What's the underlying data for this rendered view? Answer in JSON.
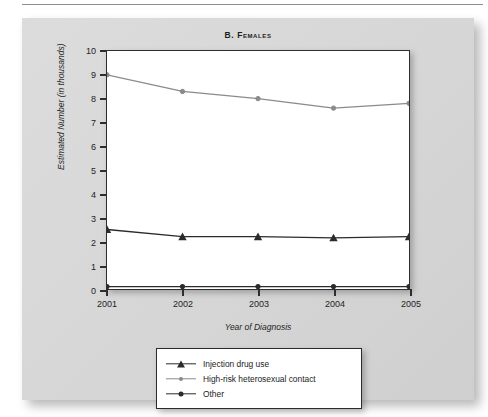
{
  "figure": {
    "title": "B. Females"
  },
  "chart_data": {
    "type": "line",
    "title": "B. Females",
    "xlabel": "Year of Diagnosis",
    "ylabel": "Estimated Number (in thousands)",
    "categories": [
      "2001",
      "2002",
      "2003",
      "2004",
      "2005"
    ],
    "x": [
      2001,
      2002,
      2003,
      2004,
      2005
    ],
    "xlim": [
      2001,
      2005
    ],
    "ylim": [
      0,
      10
    ],
    "yticks": [
      0,
      1,
      2,
      3,
      4,
      5,
      6,
      7,
      8,
      9,
      10
    ],
    "ytick_labels": [
      "0",
      "1",
      "2",
      "3",
      "4",
      "5",
      "6",
      "7",
      "8",
      "9",
      "10"
    ],
    "grid": false,
    "legend_position": "below-center",
    "series": [
      {
        "name": "Injection drug use",
        "marker": "triangle",
        "color": "#2b2b2b",
        "values": [
          2.5,
          2.2,
          2.2,
          2.15,
          2.2
        ]
      },
      {
        "name": "High-risk heterosexual contact",
        "marker": "circle",
        "color": "#8a8a8a",
        "values": [
          9.0,
          8.3,
          8.0,
          7.6,
          7.8
        ]
      },
      {
        "name": "Other",
        "marker": "circle-filled",
        "color": "#2b2b2b",
        "values": [
          0.1,
          0.1,
          0.1,
          0.1,
          0.1
        ]
      }
    ]
  }
}
